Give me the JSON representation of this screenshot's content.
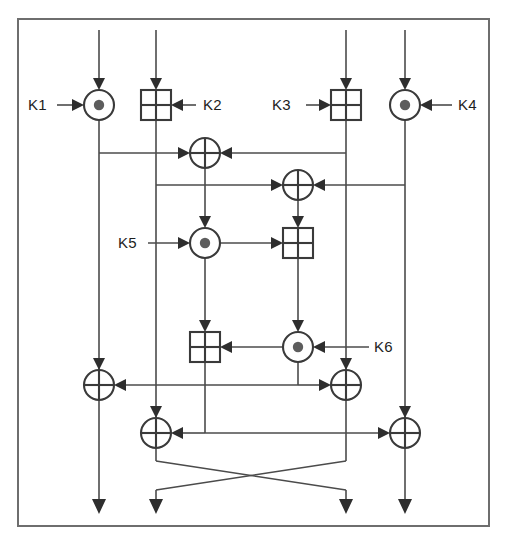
{
  "figure": {
    "border_color": "#6e6e6e",
    "wire_color": "#4b4b4b",
    "symbol_color": "#3a3a3a",
    "background": "#ffffff",
    "width": 507,
    "height": 539
  },
  "legend_symbols": [
    {
      "id": "mul",
      "name": "multiply-circle",
      "glyph": "circle-with-filled-dot",
      "meaning": "multiplication modulo 2^16+1"
    },
    {
      "id": "add",
      "name": "add-square",
      "glyph": "square-with-cross",
      "meaning": "addition modulo 2^16"
    },
    {
      "id": "xor",
      "name": "xor-circle",
      "glyph": "circle-with-cross",
      "meaning": "bitwise exclusive-or"
    }
  ],
  "keys": [
    {
      "id": "k1",
      "label": "K1",
      "operator": "mul",
      "side": "left",
      "x": 40,
      "y": 105
    },
    {
      "id": "k2",
      "label": "K2",
      "operator": "add",
      "side": "right",
      "x": 208,
      "y": 105
    },
    {
      "id": "k3",
      "label": "K3",
      "operator": "add",
      "side": "left",
      "x": 276,
      "y": 105
    },
    {
      "id": "k4",
      "label": "K4",
      "operator": "mul",
      "side": "right",
      "x": 462,
      "y": 105
    },
    {
      "id": "k5",
      "label": "K5",
      "operator": "mul",
      "side": "left",
      "x": 125,
      "y": 243
    },
    {
      "id": "k6",
      "label": "K6",
      "operator": "mul",
      "side": "right",
      "x": 373,
      "y": 347
    }
  ],
  "lanes": [
    {
      "id": "lane1",
      "x": 99,
      "name": "input-lane-1"
    },
    {
      "id": "lane2",
      "x": 156,
      "name": "input-lane-2"
    },
    {
      "id": "lane3",
      "x": 346,
      "name": "input-lane-3"
    },
    {
      "id": "lane4",
      "x": 405,
      "name": "input-lane-4"
    }
  ],
  "operators": [
    {
      "id": "op-k1",
      "type": "mul",
      "cx": 99,
      "cy": 105,
      "name": "multiply-k1"
    },
    {
      "id": "op-k2",
      "type": "add",
      "cx": 156,
      "cy": 105,
      "name": "add-k2"
    },
    {
      "id": "op-k3",
      "type": "add",
      "cx": 346,
      "cy": 105,
      "name": "add-k3"
    },
    {
      "id": "op-k4",
      "type": "mul",
      "cx": 405,
      "cy": 105,
      "name": "multiply-k4"
    },
    {
      "id": "op-x1",
      "type": "xor",
      "cx": 205,
      "cy": 153,
      "name": "xor-upper"
    },
    {
      "id": "op-x2",
      "type": "xor",
      "cx": 298,
      "cy": 185,
      "name": "xor-second"
    },
    {
      "id": "op-k5",
      "type": "mul",
      "cx": 205,
      "cy": 243,
      "name": "multiply-k5"
    },
    {
      "id": "op-a1",
      "type": "add",
      "cx": 298,
      "cy": 243,
      "name": "add-mangler-upper"
    },
    {
      "id": "op-a2",
      "type": "add",
      "cx": 205,
      "cy": 347,
      "name": "add-mangler-lower"
    },
    {
      "id": "op-k6",
      "type": "mul",
      "cx": 298,
      "cy": 347,
      "name": "multiply-k6"
    },
    {
      "id": "op-x3",
      "type": "xor",
      "cx": 99,
      "cy": 385,
      "name": "xor-out-1"
    },
    {
      "id": "op-x4",
      "type": "xor",
      "cx": 346,
      "cy": 385,
      "name": "xor-out-3"
    },
    {
      "id": "op-x5",
      "type": "xor",
      "cx": 156,
      "cy": 433,
      "name": "xor-out-2"
    },
    {
      "id": "op-x6",
      "type": "xor",
      "cx": 405,
      "cy": 433,
      "name": "xor-out-4"
    }
  ],
  "crossover": {
    "name": "middle-lane-swap",
    "top_y": 461,
    "cross_y": 473,
    "bottom_y": 490,
    "left_in_x": 156,
    "right_in_x": 346,
    "left_out_x": 156,
    "right_out_x": 346
  },
  "geometry": {
    "frame": {
      "x": 18,
      "y": 19,
      "w": 471,
      "h": 507
    },
    "top_y": 30,
    "bottom_y": 515,
    "mul_radius": 15,
    "xor_radius": 15,
    "add_half": 15,
    "dot_radius": 5.2
  }
}
